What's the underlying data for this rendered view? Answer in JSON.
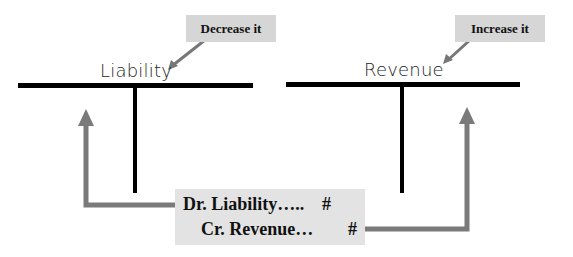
{
  "diagram": {
    "accounts": [
      {
        "name": "Liability",
        "callout": "Decrease it",
        "side_affected": "debit"
      },
      {
        "name": "Revenue",
        "callout": "Increase it",
        "side_affected": "credit"
      }
    ],
    "journal_entry": {
      "debit": {
        "label": "Dr. Liability…..",
        "amount": "#"
      },
      "credit": {
        "label": "Cr. Revenue…",
        "amount": "#"
      }
    },
    "colors": {
      "t_account_line": "#000000",
      "arrow": "#7a7a7a",
      "callout_bg": "#d6d6d6",
      "entry_bg": "#e3e3e3"
    }
  }
}
